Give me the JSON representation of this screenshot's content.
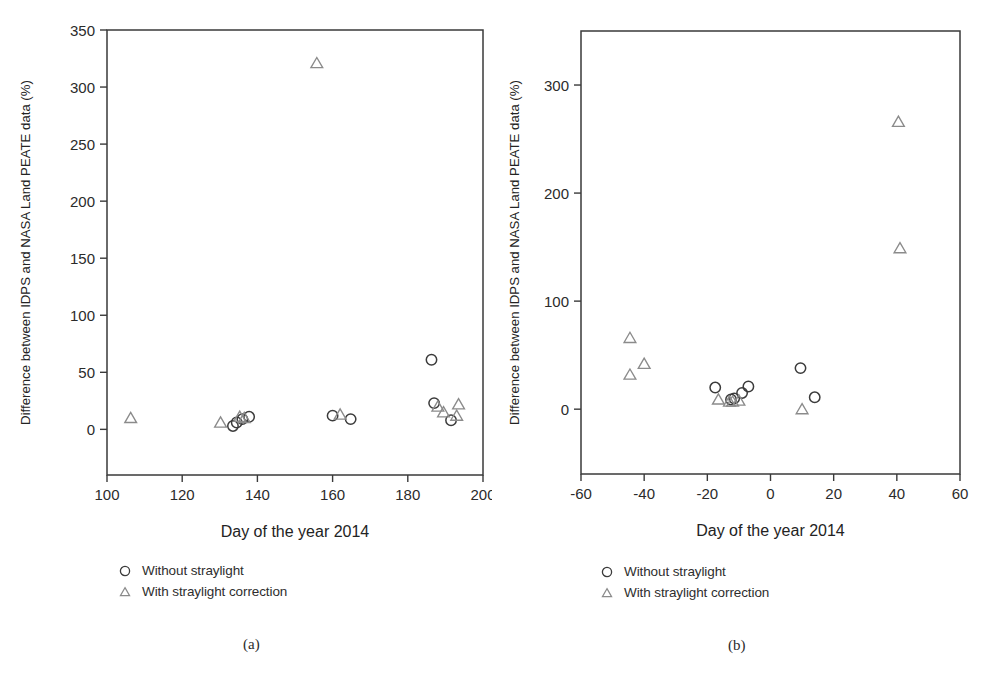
{
  "figure": {
    "caption_a": "(a)",
    "caption_b": "(b)"
  },
  "legend": {
    "without_label": "Without straylight",
    "with_label": "With straylight correction",
    "without_marker": "circle-marker",
    "with_marker": "triangle-marker"
  },
  "colors": {
    "axis": "#3a3a3a",
    "circle_marker": "#3b3b3b",
    "triangle_marker": "#8b8b8b",
    "text": "#2b2b2b",
    "background": "#ffffff"
  },
  "chart_data": [
    {
      "type": "scatter",
      "panel": "a",
      "title": "",
      "xlabel": "Day of the year 2014",
      "ylabel": "Difference between IDPS and NASA Land PEATE data (%)",
      "xlim": [
        100,
        200
      ],
      "ylim": [
        -40,
        350
      ],
      "xticks": [
        100,
        120,
        140,
        160,
        180,
        200
      ],
      "yticks": [
        0,
        50,
        100,
        150,
        200,
        250,
        300,
        350
      ],
      "xticklabels": [
        "100",
        "120",
        "140",
        "160",
        "180",
        "200"
      ],
      "yticklabels": [
        "0",
        "50",
        "100",
        "150",
        "200",
        "250",
        "300",
        "350"
      ],
      "grid": false,
      "legend_position": "below-plot",
      "series": [
        {
          "name": "Without straylight",
          "marker": "circle",
          "points": [
            {
              "x": 133.5,
              "y": 3
            },
            {
              "x": 134.5,
              "y": 6
            },
            {
              "x": 136.0,
              "y": 9
            },
            {
              "x": 137.8,
              "y": 11
            },
            {
              "x": 160.0,
              "y": 12
            },
            {
              "x": 164.8,
              "y": 9
            },
            {
              "x": 186.3,
              "y": 61
            },
            {
              "x": 187.0,
              "y": 23
            },
            {
              "x": 191.5,
              "y": 8
            }
          ]
        },
        {
          "name": "With straylight correction",
          "marker": "triangle",
          "points": [
            {
              "x": 106.3,
              "y": 10
            },
            {
              "x": 130.2,
              "y": 6
            },
            {
              "x": 135.3,
              "y": 11
            },
            {
              "x": 136.5,
              "y": 10
            },
            {
              "x": 155.8,
              "y": 321
            },
            {
              "x": 162.0,
              "y": 13
            },
            {
              "x": 188.0,
              "y": 20
            },
            {
              "x": 189.5,
              "y": 15
            },
            {
              "x": 193.5,
              "y": 22
            },
            {
              "x": 193.0,
              "y": 12
            }
          ]
        }
      ]
    },
    {
      "type": "scatter",
      "panel": "b",
      "title": "",
      "xlabel": "Day of the year 2014",
      "ylabel": "Difference between IDPS and NASA  Land PEATE data (%)",
      "xlim": [
        -60,
        60
      ],
      "ylim": [
        -60,
        350
      ],
      "xticks": [
        -60,
        -40,
        -20,
        0,
        20,
        40,
        60
      ],
      "yticks": [
        0,
        100,
        200,
        300
      ],
      "xticklabels": [
        "-60",
        "-40",
        "-20",
        "0",
        "20",
        "40",
        "60"
      ],
      "yticklabels": [
        "0",
        "100",
        "200",
        "300"
      ],
      "grid": false,
      "legend_position": "below-plot",
      "series": [
        {
          "name": "Without straylight",
          "marker": "circle",
          "points": [
            {
              "x": -17.5,
              "y": 20
            },
            {
              "x": -12.5,
              "y": 9
            },
            {
              "x": -11.5,
              "y": 10
            },
            {
              "x": -9.0,
              "y": 15
            },
            {
              "x": -7.0,
              "y": 21
            },
            {
              "x": 9.5,
              "y": 38
            },
            {
              "x": 14.0,
              "y": 11
            }
          ]
        },
        {
          "name": "With straylight correction",
          "marker": "triangle",
          "points": [
            {
              "x": -44.5,
              "y": 66
            },
            {
              "x": -44.5,
              "y": 32
            },
            {
              "x": -40.0,
              "y": 42
            },
            {
              "x": -16.5,
              "y": 9
            },
            {
              "x": -13.0,
              "y": 7
            },
            {
              "x": -12.0,
              "y": 7
            },
            {
              "x": -10.0,
              "y": 8
            },
            {
              "x": 10.0,
              "y": 0
            },
            {
              "x": 40.5,
              "y": 266
            },
            {
              "x": 41.0,
              "y": 149
            }
          ]
        }
      ]
    }
  ]
}
